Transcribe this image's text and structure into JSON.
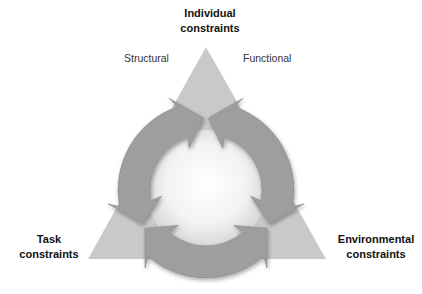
{
  "diagram": {
    "type": "constraints-triangle-cycle",
    "vertices": {
      "top": {
        "line1": "Individual",
        "line2": "constraints"
      },
      "bottom_left": {
        "line1": "Task",
        "line2": "constraints"
      },
      "bottom_right": {
        "line1": "Environmental",
        "line2": "constraints"
      }
    },
    "sub_labels": {
      "left": "Structural",
      "right": "Functional"
    }
  },
  "colors": {
    "triangle": "#c9c9c9",
    "arrows": "#9e9e9e",
    "arrow_edge": "#8a8a8a",
    "center_light": "#ffffff",
    "center_dark": "#d9d9d9",
    "text": "#111111"
  }
}
